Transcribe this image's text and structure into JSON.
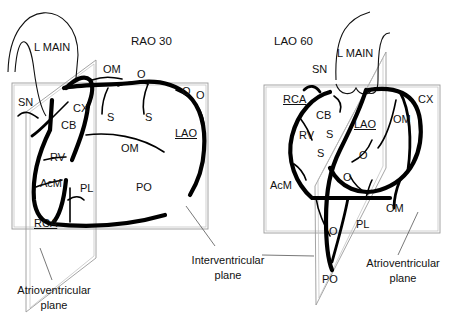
{
  "views": [
    {
      "title": "RAO 30",
      "labels": {
        "l_main": "L MAIN",
        "om_top": "OM",
        "o_top": "O",
        "o_right1": "O",
        "o_right2": "O",
        "sn": "SN",
        "cx": "CX",
        "s1": "S",
        "s2": "S",
        "cb": "CB",
        "lao": "LAO",
        "om_mid": "OM",
        "rv": "RV",
        "acm": "AcM",
        "pl": "PL",
        "po": "PO",
        "rca": "RCA"
      },
      "captions": {
        "atrioventricular_line1": "Atrioventricular",
        "atrioventricular_line2": "plane"
      }
    },
    {
      "title": "LAO 60",
      "labels": {
        "l_main": "L MAIN",
        "sn": "SN",
        "rca": "RCA",
        "cx": "CX",
        "cb": "CB",
        "lao": "LAO",
        "om_top": "OM",
        "rv": "RV",
        "s1": "S",
        "s2": "S",
        "o1": "O",
        "o2": "O",
        "acm": "AcM",
        "o3": "O",
        "pl": "PL",
        "om_bottom": "OM",
        "po": "PO"
      },
      "captions": {
        "atrioventricular_line1": "Atrioventricular",
        "atrioventricular_line2": "plane"
      }
    }
  ],
  "shared_captions": {
    "interventricular_line1": "Interventricular",
    "interventricular_line2": "plane"
  }
}
